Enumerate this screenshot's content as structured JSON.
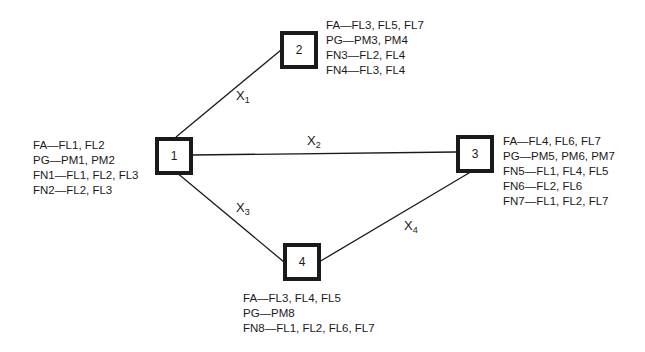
{
  "nodes": [
    {
      "id": "1",
      "label": "1",
      "attributes": [
        "FA—FL1, FL2",
        "PG—PM1, PM2",
        "FN1—FL1, FL2, FL3",
        "FN2—FL2, FL3"
      ]
    },
    {
      "id": "2",
      "label": "2",
      "attributes": [
        "FA—FL3, FL5, FL7",
        "PG—PM3, PM4",
        "FN3—FL2, FL4",
        "FN4—FL3, FL4"
      ]
    },
    {
      "id": "3",
      "label": "3",
      "attributes": [
        "FA—FL4, FL6, FL7",
        "PG—PM5, PM6, PM7",
        "FN5—FL1, FL4, FL5",
        "FN6—FL2, FL6",
        "FN7—FL1, FL2, FL7"
      ]
    },
    {
      "id": "4",
      "label": "4",
      "attributes": [
        "FA—FL3, FL4, FL5",
        "PG—PM8",
        "FN8—FL1, FL2, FL6, FL7"
      ]
    }
  ],
  "edges": [
    {
      "from": "1",
      "to": "2",
      "var": "X",
      "sub": "1"
    },
    {
      "from": "1",
      "to": "3",
      "var": "X",
      "sub": "2"
    },
    {
      "from": "1",
      "to": "4",
      "var": "X",
      "sub": "3"
    },
    {
      "from": "3",
      "to": "4",
      "var": "X",
      "sub": "4"
    }
  ]
}
